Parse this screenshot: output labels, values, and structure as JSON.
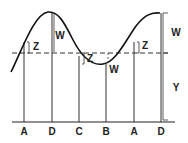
{
  "diagram": {
    "colors": {
      "stroke": "#222222",
      "background": "#ffffff"
    },
    "baseline_labels": [
      {
        "text": "A",
        "x": 24
      },
      {
        "text": "D",
        "x": 52
      },
      {
        "text": "C",
        "x": 79
      },
      {
        "text": "B",
        "x": 106
      },
      {
        "text": "A",
        "x": 134
      },
      {
        "text": "D",
        "x": 161
      }
    ],
    "segment_labels": {
      "z_left": "Z",
      "w_left_peak": "W",
      "z_mid": "Z",
      "w_trough": "W",
      "z_right": "Z",
      "w_right": "W",
      "y_right": "Y"
    }
  }
}
